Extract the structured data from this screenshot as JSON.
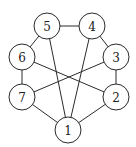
{
  "graph": {
    "node_radius": 13,
    "stroke_color": "#2a2a2a",
    "nodes": [
      {
        "id": "1",
        "label": "1",
        "x": 68,
        "y": 130
      },
      {
        "id": "2",
        "label": "2",
        "x": 116,
        "y": 97
      },
      {
        "id": "3",
        "label": "3",
        "x": 116,
        "y": 57
      },
      {
        "id": "4",
        "label": "4",
        "x": 92,
        "y": 26
      },
      {
        "id": "5",
        "label": "5",
        "x": 47,
        "y": 26
      },
      {
        "id": "6",
        "label": "6",
        "x": 22,
        "y": 57
      },
      {
        "id": "7",
        "label": "7",
        "x": 22,
        "y": 97
      }
    ],
    "edges": [
      [
        "5",
        "4"
      ],
      [
        "5",
        "6"
      ],
      [
        "5",
        "1"
      ],
      [
        "4",
        "3"
      ],
      [
        "4",
        "1"
      ],
      [
        "6",
        "7"
      ],
      [
        "6",
        "2"
      ],
      [
        "3",
        "2"
      ],
      [
        "3",
        "7"
      ],
      [
        "7",
        "1"
      ],
      [
        "2",
        "1"
      ]
    ]
  }
}
